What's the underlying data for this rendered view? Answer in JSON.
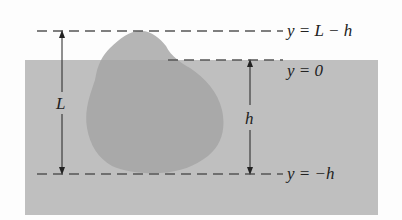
{
  "labels": {
    "top_line": "y = L − h",
    "surface_line": "y = 0",
    "bottom_line": "y = −h",
    "L": "L",
    "h": "h"
  },
  "colors": {
    "water": "#bfbfbf",
    "iceberg_above": "#b4b4b4",
    "iceberg_below": "#a8a8a8",
    "dash": "#555555",
    "background": "#fdfdfd"
  }
}
